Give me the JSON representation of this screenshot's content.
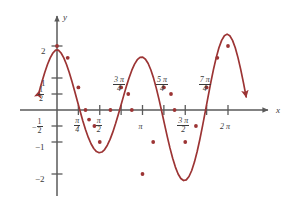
{
  "figure": {
    "kind": "cartesian-graph",
    "background": "#ffffff",
    "curve_color": "#9c3434",
    "axis_color": "#5a5a5a",
    "text_color": "#3a3a3a",
    "axis_labels": {
      "x": "x",
      "y": "y"
    }
  },
  "y_ticks": [
    {
      "label": "2",
      "value": 2.0
    },
    {
      "label": "1",
      "value": 1.0
    },
    {
      "label": "1/2",
      "num": "1",
      "den": "2",
      "value": 0.5
    },
    {
      "label": "-1/2",
      "sign": "−",
      "num": "1",
      "den": "2",
      "value": -0.5
    },
    {
      "label": "-1",
      "value": -1.0
    },
    {
      "label": "-2",
      "value": -2.0
    }
  ],
  "x_ticks": [
    {
      "label": "pi/4",
      "num": "π",
      "den": "4",
      "value": 0.785398,
      "side": "below"
    },
    {
      "label": "pi/2",
      "num": "π",
      "den": "2",
      "value": 1.570796,
      "side": "below"
    },
    {
      "label": "3pi/4",
      "num": "3 π",
      "den": "4",
      "value": 2.356194,
      "side": "above"
    },
    {
      "label": "pi",
      "num": "π",
      "den": "",
      "value": 3.141593,
      "side": "below"
    },
    {
      "label": "5pi/4",
      "num": "5 π",
      "den": "4",
      "value": 3.926991,
      "side": "above"
    },
    {
      "label": "3pi/2",
      "num": "3 π",
      "den": "2",
      "value": 4.712389,
      "side": "below"
    },
    {
      "label": "7pi/4",
      "num": "7 π",
      "den": "4",
      "value": 5.497787,
      "side": "above"
    },
    {
      "label": "2pi",
      "num": "2 π",
      "den": "",
      "value": 6.283185,
      "side": "below"
    }
  ],
  "chart_data": {
    "type": "line",
    "title": "",
    "xlabel": "x",
    "ylabel": "y",
    "xlim": [
      -0.72,
      7.05
    ],
    "ylim": [
      -2.55,
      2.6
    ],
    "grid": false,
    "legend": null,
    "function": "y = cos(x) + cos(2x)",
    "x_tick_labels": [
      "π/4",
      "π/2",
      "3π/4",
      "π",
      "5π/4",
      "3π/2",
      "7π/4",
      "2π"
    ],
    "x_tick_values": [
      0.785398,
      1.570796,
      2.356194,
      3.141593,
      3.926991,
      4.712389,
      5.497787,
      6.283185
    ],
    "y_tick_labels": [
      "2",
      "1",
      "1/2",
      "-1/2",
      "-1",
      "-2"
    ],
    "y_tick_values": [
      2,
      1,
      0.5,
      -0.5,
      -1,
      -2
    ],
    "arrow_start": {
      "x": -0.65,
      "y": 0.72,
      "direction": "down-left"
    },
    "arrow_end": {
      "x": 6.95,
      "y": 0.72,
      "direction": "down-right"
    },
    "marked_points": [
      {
        "x": 0.0,
        "y": 2.0
      },
      {
        "x": 0.3927,
        "y": 1.631
      },
      {
        "x": 0.7854,
        "y": 0.707
      },
      {
        "x": 1.0472,
        "y": 0.0
      },
      {
        "x": 1.1781,
        "y": -0.3
      },
      {
        "x": 1.3744,
        "y": -0.5
      },
      {
        "x": 1.5708,
        "y": -1.0
      },
      {
        "x": 1.9635,
        "y": 0.0
      },
      {
        "x": 2.3562,
        "y": 0.707
      },
      {
        "x": 2.618,
        "y": 0.5
      },
      {
        "x": 2.7489,
        "y": 0.0
      },
      {
        "x": 3.1416,
        "y": -2.0
      },
      {
        "x": 3.5343,
        "y": -1.0
      },
      {
        "x": 3.927,
        "y": 0.707
      },
      {
        "x": 4.1888,
        "y": 0.5
      },
      {
        "x": 4.3197,
        "y": 0.0
      },
      {
        "x": 4.7124,
        "y": -1.0
      },
      {
        "x": 5.1051,
        "y": -0.5
      },
      {
        "x": 5.4978,
        "y": 0.707
      },
      {
        "x": 5.8905,
        "y": 1.631
      },
      {
        "x": 6.2832,
        "y": 2.0
      }
    ],
    "series": [
      {
        "name": "y = cos(x) + cos(2x)",
        "color": "#9c3434",
        "x": [
          -0.65,
          -0.55,
          -0.45,
          -0.35,
          -0.25,
          -0.15,
          -0.05,
          0.05,
          0.15,
          0.25,
          0.35,
          0.45,
          0.55,
          0.65,
          0.75,
          0.85,
          0.95,
          1.05,
          1.15,
          1.25,
          1.35,
          1.45,
          1.55,
          1.65,
          1.75,
          1.85,
          1.95,
          2.05,
          2.15,
          2.25,
          2.35,
          2.45,
          2.55,
          2.65,
          2.75,
          2.85,
          2.95,
          3.05,
          3.15,
          3.25,
          3.35,
          3.45,
          3.55,
          3.65,
          3.75,
          3.85,
          3.95,
          4.05,
          4.15,
          4.25,
          4.35,
          4.45,
          4.55,
          4.65,
          4.75,
          4.85,
          4.95,
          5.05,
          5.15,
          5.25,
          5.35,
          5.45,
          5.55,
          5.65,
          5.75,
          5.85,
          5.95,
          6.05,
          6.15,
          6.25,
          6.35,
          6.45,
          6.55,
          6.65,
          6.75,
          6.85,
          6.95
        ],
        "y": [
          0.586,
          0.891,
          1.174,
          1.423,
          1.629,
          1.78,
          1.872,
          1.872,
          1.78,
          1.629,
          1.423,
          1.174,
          0.891,
          0.586,
          0.271,
          -0.042,
          -0.341,
          -0.616,
          -0.857,
          -1.055,
          -1.204,
          -1.299,
          -1.336,
          -1.314,
          -1.235,
          -1.101,
          -0.918,
          -0.692,
          -0.432,
          -0.148,
          0.149,
          0.449,
          0.739,
          1.008,
          1.243,
          1.434,
          1.571,
          1.645,
          1.651,
          1.587,
          1.452,
          1.251,
          0.989,
          0.676,
          0.323,
          -0.054,
          -0.441,
          -0.823,
          -1.184,
          -1.509,
          -1.785,
          -1.999,
          -2.141,
          -2.204,
          -2.183,
          -2.078,
          -1.891,
          -1.628,
          -1.298,
          -0.914,
          -0.49,
          -0.042,
          0.412,
          0.854,
          1.268,
          1.637,
          1.944,
          2.176,
          2.321,
          2.371,
          2.321,
          2.176,
          1.944,
          1.637,
          1.268,
          0.854,
          0.412
        ]
      }
    ]
  }
}
